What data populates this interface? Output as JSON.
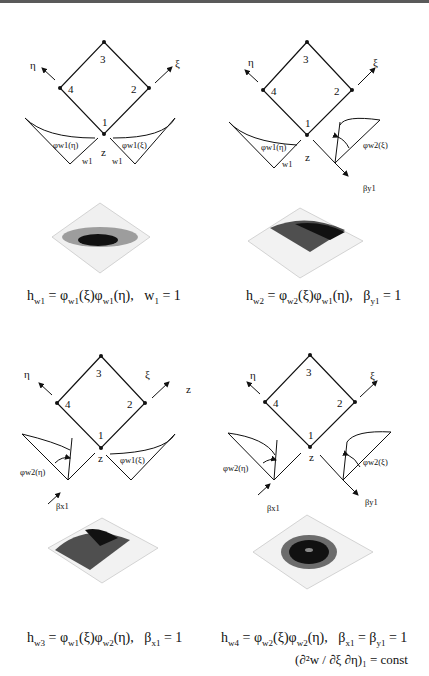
{
  "figure": {
    "panels": [
      {
        "id": "hw1",
        "nodes": [
          "1",
          "2",
          "3",
          "4"
        ],
        "axes": {
          "eta": "η",
          "xi": "ξ",
          "z": "z"
        },
        "left_curve_label": "φw1(η)",
        "right_curve_label": "φw1(ξ)",
        "left_dof_label": "w1",
        "right_dof_label": "w1",
        "caption": {
          "lhs": "h",
          "lhs_sub": "w1",
          "eq": " = φ",
          "f1_sub": "w1",
          "f1_arg": "(ξ)φ",
          "f2_sub": "w1",
          "f2_arg": "(η),",
          "cond": "w",
          "cond_sub": "1",
          "cond_val": " = 1"
        }
      },
      {
        "id": "hw2",
        "nodes": [
          "1",
          "2",
          "3",
          "4"
        ],
        "axes": {
          "eta": "η",
          "xi": "ξ",
          "z": "z"
        },
        "left_curve_label": "φw1(η)",
        "right_curve_label": "φw2(ξ)",
        "left_dof_label": "w1",
        "right_dof_label": "βy1",
        "caption": {
          "lhs": "h",
          "lhs_sub": "w2",
          "eq": " = φ",
          "f1_sub": "w2",
          "f1_arg": "(ξ)φ",
          "f2_sub": "w1",
          "f2_arg": "(η),",
          "cond": "β",
          "cond_sub": "y1",
          "cond_val": " = 1"
        }
      },
      {
        "id": "hw3",
        "nodes": [
          "1",
          "2",
          "3",
          "4"
        ],
        "axes": {
          "eta": "η",
          "xi": "ξ",
          "z": "z",
          "z_outer": "z"
        },
        "left_curve_label": "φw2(η)",
        "right_curve_label": "φw1(ξ)",
        "left_dof_label": "βx1",
        "caption": {
          "lhs": "h",
          "lhs_sub": "w3",
          "eq": " = φ",
          "f1_sub": "w1",
          "f1_arg": "(ξ)φ",
          "f2_sub": "w2",
          "f2_arg": "(η),",
          "cond": "β",
          "cond_sub": "x1",
          "cond_val": " = 1"
        }
      },
      {
        "id": "hw4",
        "nodes": [
          "1",
          "2",
          "3",
          "4"
        ],
        "axes": {
          "eta": "η",
          "xi": "ξ",
          "z": "z"
        },
        "left_curve_label": "φw2(η)",
        "right_curve_label": "φw2(ξ)",
        "left_dof_label": "βx1",
        "right_dof_label": "βy1",
        "caption": {
          "lhs": "h",
          "lhs_sub": "w4",
          "eq": " = φ",
          "f1_sub": "w2",
          "f1_arg": "(ξ)φ",
          "f2_sub": "w2",
          "f2_arg": "(η),",
          "cond": "β",
          "cond_sub": "x1",
          "cond_val": " = β",
          "cond2_sub": "y1",
          "cond2_val": " = 1"
        }
      }
    ],
    "footnote": "(∂²w / ∂ξ ∂η)₁ = const"
  }
}
